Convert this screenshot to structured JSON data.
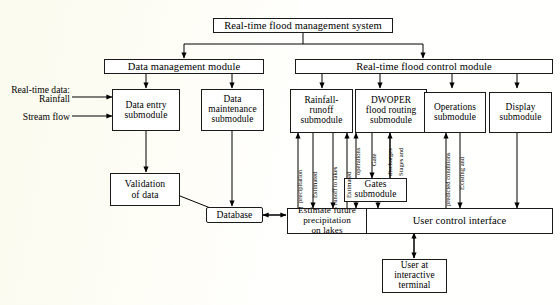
{
  "diagram": {
    "colors": {
      "ink": "#000000",
      "box_border": "#1a1a1a",
      "paper": "#fffffd"
    },
    "nodes": {
      "root": "Real-time flood management system",
      "data_management_module": "Data management module",
      "flood_control_module": "Real-time flood control module",
      "data_entry": "Data entry\nsubmodule",
      "data_entry_l1": "Data entry",
      "data_entry_l2": "submodule",
      "data_maintenance_l1": "Data",
      "data_maintenance_l2": "maintenance",
      "data_maintenance_l3": "submodule",
      "rainfall_runoff_l1": "Rainfall-",
      "rainfall_runoff_l2": "runoff",
      "rainfall_runoff_l3": "submodule",
      "dwoper_l1": "DWOPER",
      "dwoper_l2": "flood routing",
      "dwoper_l3": "submodule",
      "operations_l1": "Operations",
      "operations_l2": "submodule",
      "display_l1": "Display",
      "display_l2": "submodule",
      "validation_l1": "Validation",
      "validation_l2": "of data",
      "database": "Database",
      "gates_l1": "Gates",
      "gates_l2": "submodule",
      "estimate_l1": "Estimate future",
      "estimate_l2": "precipitation",
      "estimate_l3": "on lakes",
      "user_control_interface": "User control interface",
      "user_terminal_l1": "User at",
      "user_terminal_l2": "interactive",
      "user_terminal_l3": "terminal"
    },
    "input_labels": {
      "realtime_data_l1": "Real-time data:",
      "realtime_data_l2": "Rainfall",
      "stream_flow": "Stream flow"
    },
    "edge_labels": {
      "estimated_precipitation_l1": "Estimated",
      "estimated_precipitation_l2": "precipitation",
      "estimated_runoff_l1": "Estimated",
      "estimated_runoff_l2": "runoff to lakes",
      "gate_operations_l1": "Gate",
      "gate_operations_l2": "operations",
      "stages_discharges_l1": "Stages and",
      "stages_discharges_l2": "discharges",
      "existing_predicted_l1": "Existing and",
      "existing_predicted_l2": "predicted conditions"
    }
  }
}
